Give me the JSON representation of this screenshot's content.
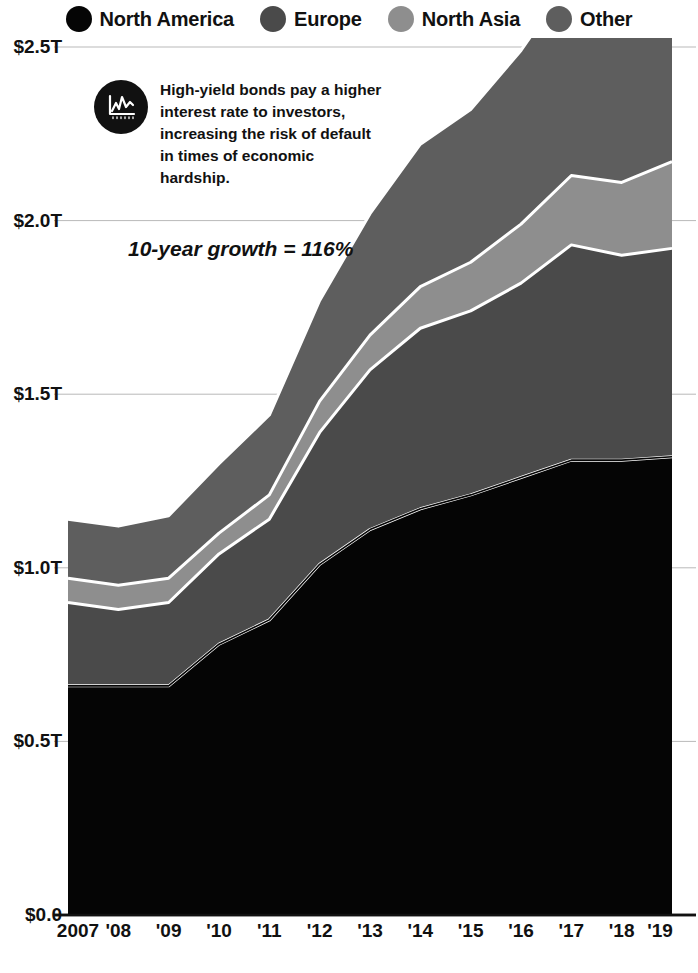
{
  "legend": {
    "items": [
      {
        "label": "North America",
        "color": "#050505",
        "icon": "legend-dot-north-america"
      },
      {
        "label": "Europe",
        "color": "#4a4a4a",
        "icon": "legend-dot-europe"
      },
      {
        "label": "North Asia",
        "color": "#8e8e8e",
        "icon": "legend-dot-north-asia"
      },
      {
        "label": "Other",
        "color": "#5e5e5e",
        "icon": "legend-dot-other"
      }
    ]
  },
  "annotation": {
    "icon": "line-chart-icon",
    "text": "High-yield bonds pay a higher interest rate to investors, increasing the risk of default in times of economic hardship."
  },
  "growth_callout": {
    "text": "10-year growth = 116%"
  },
  "axis": {
    "y_ticks": [
      {
        "label": "$2.5T",
        "value": 2.5
      },
      {
        "label": "$2.0T",
        "value": 2.0
      },
      {
        "label": "$1.5T",
        "value": 1.5
      },
      {
        "label": "$1.0T",
        "value": 1.0
      },
      {
        "label": "$0.5T",
        "value": 0.5
      },
      {
        "label": "$0.0",
        "value": 0.0
      }
    ],
    "x_ticks": [
      "2007",
      "'08",
      "'09",
      "'10",
      "'11",
      "'12",
      "'13",
      "'14",
      "'15",
      "'16",
      "'17",
      "'18",
      "'19"
    ]
  },
  "chart_data": {
    "type": "area",
    "stacked": true,
    "title": "",
    "subtitle": "",
    "xlabel": "",
    "ylabel": "",
    "ylim": [
      0.0,
      2.6
    ],
    "grid": true,
    "grid_axis": "y",
    "legend_position": "top",
    "unit": "USD trillions",
    "categories": [
      "2007",
      "2008",
      "2009",
      "2010",
      "2011",
      "2012",
      "2013",
      "2014",
      "2015",
      "2016",
      "2017",
      "2018",
      "2019"
    ],
    "tick_labels": [
      "2007",
      "'08",
      "'09",
      "'10",
      "'11",
      "'12",
      "'13",
      "'14",
      "'15",
      "'16",
      "'17",
      "'18",
      "'19"
    ],
    "series": [
      {
        "name": "North America",
        "color": "#050505",
        "values": [
          0.66,
          0.66,
          0.66,
          0.78,
          0.85,
          1.01,
          1.11,
          1.17,
          1.21,
          1.26,
          1.31,
          1.31,
          1.32
        ]
      },
      {
        "name": "Europe",
        "color": "#4a4a4a",
        "values": [
          0.24,
          0.22,
          0.24,
          0.26,
          0.29,
          0.38,
          0.46,
          0.52,
          0.53,
          0.56,
          0.62,
          0.59,
          0.6
        ]
      },
      {
        "name": "North Asia",
        "color": "#8e8e8e",
        "values": [
          0.07,
          0.07,
          0.07,
          0.06,
          0.07,
          0.09,
          0.1,
          0.12,
          0.14,
          0.17,
          0.2,
          0.21,
          0.25
        ]
      },
      {
        "name": "Other",
        "color": "#5e5e5e",
        "values": [
          0.17,
          0.17,
          0.18,
          0.2,
          0.23,
          0.29,
          0.35,
          0.41,
          0.44,
          0.5,
          0.57,
          0.56,
          0.56
        ]
      }
    ],
    "cumulative_totals": [
      1.14,
      1.12,
      1.15,
      1.3,
      1.44,
      1.77,
      2.02,
      2.22,
      2.32,
      2.49,
      2.7,
      2.67,
      2.73
    ],
    "annotations": [
      {
        "text": "10-year growth = 116%",
        "style": "bold-italic"
      }
    ]
  }
}
